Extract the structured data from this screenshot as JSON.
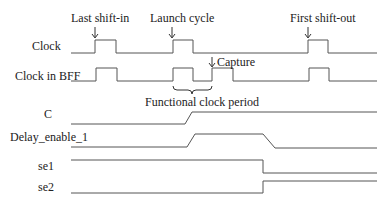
{
  "annotations": {
    "last_shift_in": "Last shift-in",
    "launch_cycle": "Launch cycle",
    "first_shift_out": "First shift-out",
    "capture": "Capture",
    "functional_clock_period": "Functional clock period"
  },
  "signals": [
    {
      "name": "Clock"
    },
    {
      "name": "Clock in BFF"
    },
    {
      "name": "C"
    },
    {
      "name": "Delay_enable_1"
    },
    {
      "name": "se1"
    },
    {
      "name": "se2"
    }
  ],
  "colors": {
    "wave": "#555555",
    "text": "#222222",
    "background": "#ffffff"
  }
}
